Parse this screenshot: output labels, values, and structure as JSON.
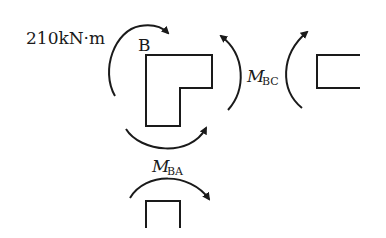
{
  "diagram": {
    "applied_moment_label": "210kN·m",
    "joint_label": "B",
    "moment_bc": {
      "symbol": "M",
      "subscript": "BC"
    },
    "moment_ba": {
      "symbol": "M",
      "subscript": "BA"
    }
  },
  "colors": {
    "stroke": "#1a1a1a",
    "background": "#ffffff"
  }
}
